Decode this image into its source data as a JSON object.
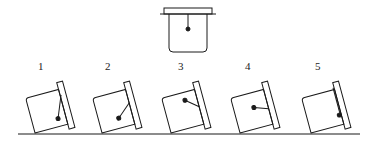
{
  "diagram": {
    "colors": {
      "stroke": "#1a1a1a",
      "background": "#ffffff"
    },
    "reference": {
      "label": "",
      "pendulum_direction": "down"
    },
    "positions": [
      {
        "label": "1",
        "x": 41
      },
      {
        "label": "2",
        "x": 108
      },
      {
        "label": "3",
        "x": 181
      },
      {
        "label": "4",
        "x": 248
      },
      {
        "label": "5",
        "x": 318
      }
    ]
  }
}
